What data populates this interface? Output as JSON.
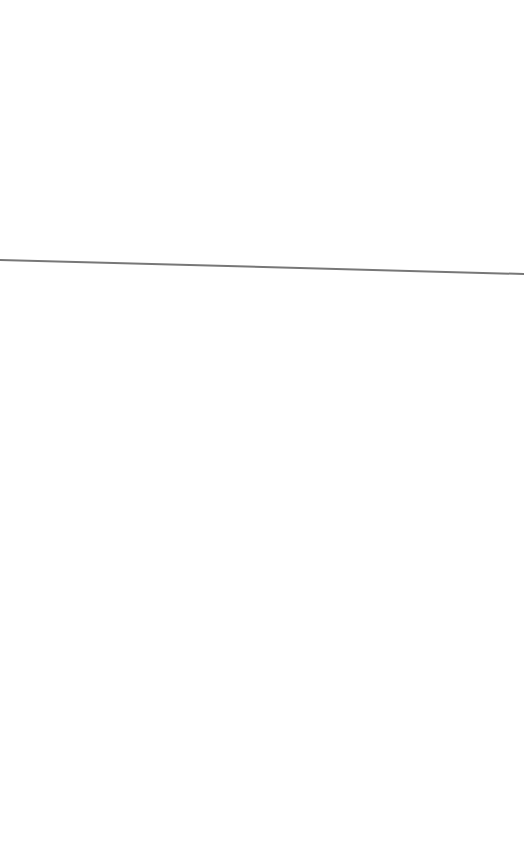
{
  "page": {
    "background": "#ffffff"
  },
  "divider": {
    "color": "#777777",
    "x1": 0,
    "y1": 260,
    "x2": 524,
    "y2": 274,
    "stroke_width": 2
  }
}
